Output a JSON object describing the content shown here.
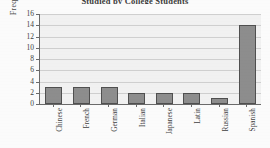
{
  "chart_data": {
    "type": "bar",
    "title": "Studied by College Students",
    "xlabel": "",
    "ylabel": "Frequency",
    "categories": [
      "Chinese",
      "French",
      "German",
      "Italian",
      "Japanese",
      "Latin",
      "Russian",
      "Spanish"
    ],
    "values": [
      3,
      3,
      3,
      2,
      2,
      2,
      1,
      14
    ],
    "ylim": [
      0,
      16
    ],
    "ytick_labels": [
      "0",
      "2",
      "4",
      "6",
      "8",
      "10",
      "12",
      "14",
      "16"
    ],
    "ytick_values": [
      0,
      2,
      4,
      6,
      8,
      10,
      12,
      14,
      16
    ],
    "grid": true,
    "legend": false,
    "bar_color": "#8d8d8d",
    "bar_border_color": "#4f4f4f",
    "plot_background": "#f1f1f1",
    "gridline_color": "#cfcfcf",
    "axis_color": "#6a6a6a"
  }
}
